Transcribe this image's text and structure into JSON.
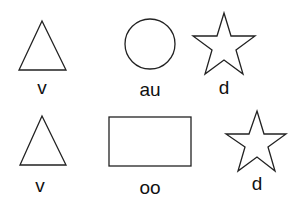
{
  "figure": {
    "background": "#ffffff",
    "stroke_color": "#222222",
    "rows": [
      {
        "items": [
          {
            "shape": "triangle",
            "label": "v"
          },
          {
            "shape": "circle",
            "label": "au"
          },
          {
            "shape": "star",
            "label": "d"
          }
        ]
      },
      {
        "items": [
          {
            "shape": "triangle",
            "label": "v"
          },
          {
            "shape": "rectangle",
            "label": "oo"
          },
          {
            "shape": "star",
            "label": "d"
          }
        ]
      }
    ]
  }
}
